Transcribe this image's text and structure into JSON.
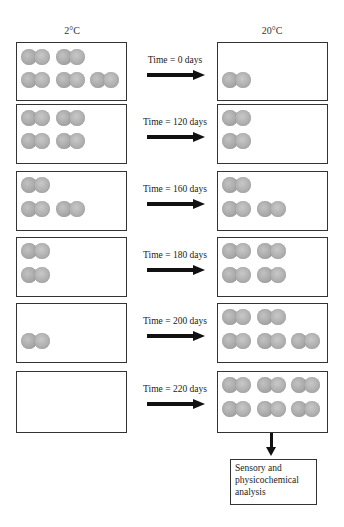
{
  "headers": {
    "left": "2°C",
    "right": "20°C"
  },
  "rows": [
    {
      "time_label": "Time = 0 days",
      "top": 42,
      "height": 59,
      "left_count": 5,
      "right_count": 1,
      "left_pairs": [
        [
          4,
          6
        ],
        [
          39,
          6
        ],
        [
          4,
          29
        ],
        [
          39,
          29
        ],
        [
          73,
          29
        ]
      ],
      "right_pairs": [
        [
          4,
          29
        ]
      ]
    },
    {
      "time_label": "Time = 120 days",
      "top": 104,
      "height": 60,
      "left_count": 4,
      "right_count": 2,
      "left_pairs": [
        [
          4,
          5
        ],
        [
          39,
          5
        ],
        [
          4,
          28
        ],
        [
          39,
          28
        ]
      ],
      "right_pairs": [
        [
          4,
          5
        ],
        [
          4,
          28
        ]
      ]
    },
    {
      "time_label": "Time = 160 days",
      "top": 171,
      "height": 60,
      "left_count": 3,
      "right_count": 3,
      "left_pairs": [
        [
          4,
          5
        ],
        [
          4,
          29
        ],
        [
          39,
          29
        ]
      ],
      "right_pairs": [
        [
          4,
          5
        ],
        [
          4,
          29
        ],
        [
          39,
          29
        ]
      ]
    },
    {
      "time_label": "Time = 180 days",
      "top": 237,
      "height": 60,
      "left_count": 2,
      "right_count": 4,
      "left_pairs": [
        [
          4,
          5
        ],
        [
          4,
          29
        ]
      ],
      "right_pairs": [
        [
          4,
          5
        ],
        [
          39,
          5
        ],
        [
          4,
          29
        ],
        [
          39,
          29
        ]
      ]
    },
    {
      "time_label": "Time = 200 days",
      "top": 303,
      "height": 60,
      "left_count": 1,
      "right_count": 5,
      "left_pairs": [
        [
          4,
          29
        ]
      ],
      "right_pairs": [
        [
          4,
          5
        ],
        [
          39,
          5
        ],
        [
          4,
          29
        ],
        [
          39,
          29
        ],
        [
          73,
          29
        ]
      ]
    },
    {
      "time_label": "Time = 220 days",
      "top": 371,
      "height": 62,
      "left_count": 0,
      "right_count": 6,
      "left_pairs": [],
      "right_pairs": [
        [
          4,
          5
        ],
        [
          39,
          5
        ],
        [
          73,
          5
        ],
        [
          4,
          29
        ],
        [
          39,
          29
        ],
        [
          73,
          29
        ]
      ]
    }
  ],
  "final_step": {
    "label": "Sensory and physicochemical analysis"
  },
  "icons": {
    "sample": "cheese-pair-icon",
    "arrow_right": "right-arrow-icon",
    "arrow_down": "down-arrow-icon"
  },
  "colors": {
    "sample_fill": "#a9a9a9",
    "border": "#333333",
    "arrow": "#111111"
  }
}
